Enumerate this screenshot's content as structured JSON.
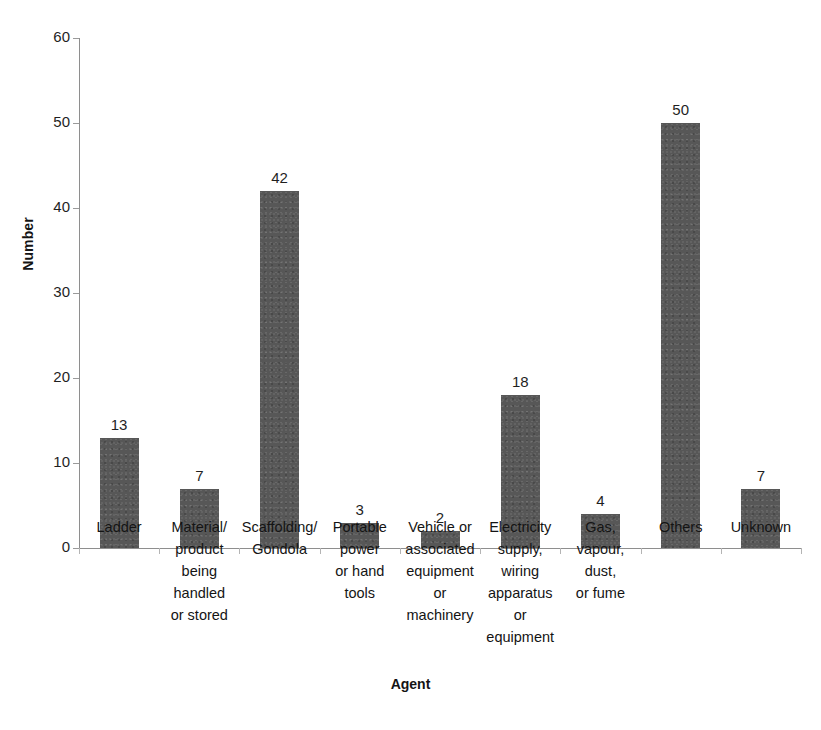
{
  "chart_data": {
    "type": "bar",
    "title": "",
    "xlabel": "Agent",
    "ylabel": "Number",
    "ylim": [
      0,
      60
    ],
    "yticks": [
      0,
      10,
      20,
      30,
      40,
      50,
      60
    ],
    "grid": false,
    "legend": null,
    "bar_color": "#575757",
    "categories": [
      "Ladder",
      "Material/ product being handled or stored",
      "Scaffolding/ Gondola",
      "Portable power or hand tools",
      "Vehicle or associated equipment or machinery",
      "Electricity supply, wiring apparatus or equipment",
      "Gas, vapour, dust, or fume",
      "Others",
      "Unknown"
    ],
    "category_lines": [
      [
        "Ladder"
      ],
      [
        "Material/",
        "product",
        "being",
        "handled",
        "or stored"
      ],
      [
        "Scaffolding/",
        "Gondola"
      ],
      [
        "Portable",
        "power",
        "or hand",
        "tools"
      ],
      [
        "Vehicle or",
        "associated",
        "equipment",
        "or",
        "machinery"
      ],
      [
        "Electricity",
        "supply,",
        "wiring",
        "apparatus",
        "or",
        "equipment"
      ],
      [
        "Gas,",
        "vapour,",
        "dust,",
        "or fume"
      ],
      [
        "Others"
      ],
      [
        "Unknown"
      ]
    ],
    "values": [
      13,
      7,
      42,
      3,
      2,
      18,
      4,
      50,
      7
    ],
    "value_labels": [
      "13",
      "7",
      "42",
      "3",
      "2",
      "18",
      "4",
      "50",
      "7"
    ]
  }
}
